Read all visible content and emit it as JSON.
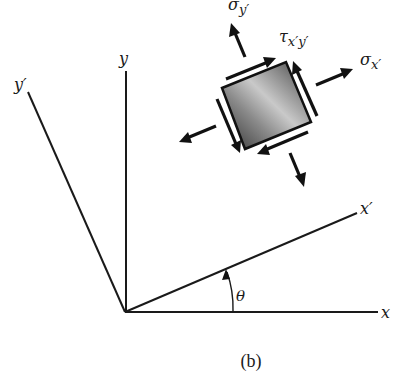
{
  "figure": {
    "caption": "(b)"
  },
  "axes": {
    "x_label": "x",
    "y_label": "y",
    "x_prime_label": "x′",
    "y_prime_label": "y′",
    "angle_label": "θ"
  },
  "stress_element": {
    "sigma_x_prime": {
      "symbol": "σ",
      "subscript": "x′"
    },
    "sigma_y_prime": {
      "symbol": "σ",
      "subscript": "y′"
    },
    "tau_x_prime_y_prime": {
      "symbol": "τ",
      "subscript": "x′y′"
    }
  },
  "colors": {
    "line": "#1a1a1a",
    "element_dark": "#3a3a3a",
    "element_light": "#cfcfcf"
  }
}
